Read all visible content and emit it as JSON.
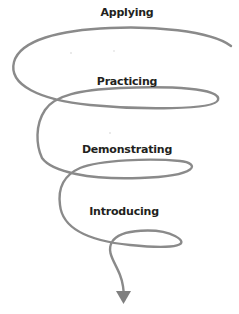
{
  "diagram": {
    "type": "spiral",
    "direction": "top-to-bottom",
    "stroke_color": "#8a8a8a",
    "text_color": "#231f20",
    "stages": [
      {
        "label": "Applying",
        "x": 127,
        "y": 6
      },
      {
        "label": "Practicing",
        "x": 127,
        "y": 75
      },
      {
        "label": "Demonstrating",
        "x": 127,
        "y": 143
      },
      {
        "label": "Introducing",
        "x": 124,
        "y": 205
      }
    ],
    "arrow": {
      "icon": "arrow-down-triangle-icon"
    }
  }
}
